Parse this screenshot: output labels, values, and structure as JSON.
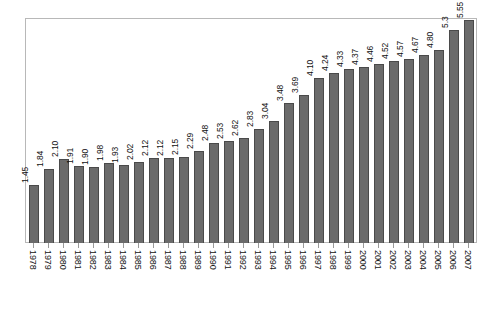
{
  "chart_data": {
    "type": "bar",
    "title": "",
    "subtitle": "",
    "xlabel": "",
    "ylabel": "",
    "ylim": [
      0,
      5.55
    ],
    "grid": false,
    "legend": null,
    "bar_color": "#6b6b6b",
    "bar_edge_color": "#4a4a4a",
    "frame_color": "#b8b8b8",
    "background_color": "#ffffff",
    "value_labels_rotated": true,
    "tick_labels_rotated": true,
    "categories": [
      "1978",
      "1979",
      "1980",
      "1981",
      "1982",
      "1983",
      "1984",
      "1985",
      "1986",
      "1987",
      "1988",
      "1989",
      "1990",
      "1991",
      "1992",
      "1993",
      "1994",
      "1995",
      "1996",
      "1997",
      "1998",
      "1999",
      "2000",
      "2001",
      "2002",
      "2003",
      "2004",
      "2005",
      "2006",
      "2007"
    ],
    "values": [
      1.45,
      1.84,
      2.1,
      1.91,
      1.9,
      1.98,
      1.93,
      2.02,
      2.12,
      2.12,
      2.15,
      2.29,
      2.48,
      2.53,
      2.62,
      2.83,
      3.04,
      3.48,
      3.69,
      4.1,
      4.24,
      4.33,
      4.37,
      4.46,
      4.52,
      4.57,
      4.67,
      4.8,
      5.3,
      5.55
    ],
    "value_labels": [
      "1.45",
      "1.84",
      "2.10",
      "1.91",
      "1.90",
      "1.98",
      "1.93",
      "2.02",
      "2.12",
      "2.12",
      "2.15",
      "2.29",
      "2.48",
      "2.53",
      "2.62",
      "2.83",
      "3.04",
      "3.48",
      "3.69",
      "4.10",
      "4.24",
      "4.33",
      "4.37",
      "4.46",
      "4.52",
      "4.57",
      "4.67",
      "4.80",
      "5.3",
      "5.55"
    ]
  }
}
